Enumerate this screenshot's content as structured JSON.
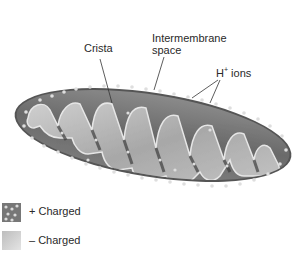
{
  "diagram": {
    "labels": {
      "crista": "Crista",
      "intermembrane_line1": "Intermembrane",
      "intermembrane_line2": "space",
      "h_ions_base": "H",
      "h_ions_sup": "+",
      "h_ions_rest": " ions"
    },
    "legend": [
      {
        "symbol": "+",
        "label": "+ Charged",
        "color": "#7a7a7a"
      },
      {
        "symbol": "–",
        "label": "– Charged",
        "color": "#c8c8c8"
      }
    ],
    "colors": {
      "outer_membrane": "#6e6e6e",
      "intermembrane_dark": "#5a5a5a",
      "matrix_light": "#b4b4b4",
      "ion_dot": "#d8d8d8"
    }
  }
}
